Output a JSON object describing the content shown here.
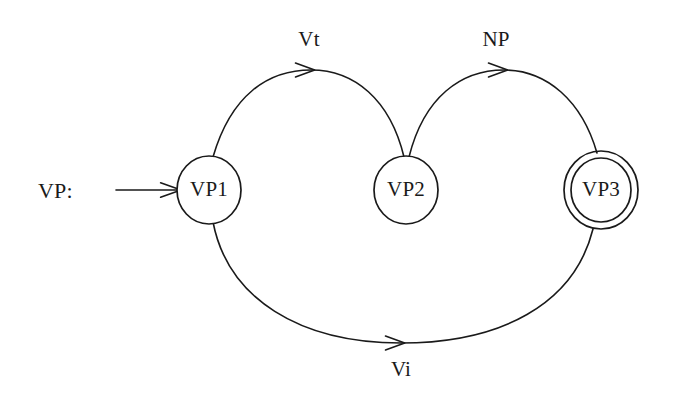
{
  "diagram": {
    "type": "finite-state-machine",
    "background_color": "#ffffff",
    "stroke_color": "#1a1a1a",
    "entry": {
      "label": "VP:",
      "label_x": 38,
      "label_y": 198,
      "arrow_x1": 116,
      "arrow_y1": 190,
      "arrow_x2": 177,
      "arrow_y2": 190,
      "icon": "arrow-right-icon"
    },
    "states": [
      {
        "id": "vp1",
        "label": "VP1",
        "cx": 209,
        "cy": 190,
        "rx": 32,
        "ry": 34,
        "accepting": false
      },
      {
        "id": "vp2",
        "label": "VP2",
        "cx": 406,
        "cy": 190,
        "rx": 32,
        "ry": 34,
        "accepting": false
      },
      {
        "id": "vp3",
        "label": "VP3",
        "cx": 601,
        "cy": 190,
        "rx": 30,
        "ry": 32,
        "outer_rx": 37,
        "outer_ry": 39,
        "accepting": true
      }
    ],
    "transitions": [
      {
        "id": "vt",
        "label": "Vt",
        "from": "vp1",
        "to": "vp2",
        "label_x": 309,
        "label_y": 46,
        "path": "M 213,157 C 231,95 268,70 311,70 C 354,70 390,99 404,157",
        "arrow_x": 311,
        "arrow_y": 70,
        "arrow_angle": 0
      },
      {
        "id": "np",
        "label": "NP",
        "from": "vp2",
        "to": "vp3",
        "label_x": 496,
        "label_y": 46,
        "path": "M 409,157 C 424,97 461,70 504,70 C 547,70 582,101 597,153",
        "arrow_x": 504,
        "arrow_y": 70,
        "arrow_angle": 0
      },
      {
        "id": "vi",
        "label": "Vi",
        "from": "vp1",
        "to": "vp3",
        "label_x": 401,
        "label_y": 376,
        "path": "M 213,222 C 228,299 300,343 401,343 C 500,343 574,305 593,229",
        "arrow_x": 401,
        "arrow_y": 343,
        "arrow_angle": 0
      }
    ]
  }
}
